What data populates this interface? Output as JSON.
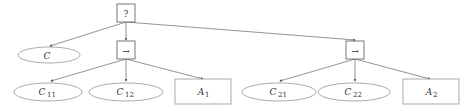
{
  "diagram": {
    "type": "tree",
    "colors": {
      "stroke": "#777777",
      "edge": "#666666",
      "text": "#333333",
      "background": "#ffffff"
    },
    "nodes": [
      {
        "id": "root",
        "shape": "square",
        "label": "?",
        "sub": ""
      },
      {
        "id": "c",
        "shape": "ellipse",
        "label": "C",
        "sub": ""
      },
      {
        "id": "seq1",
        "shape": "square",
        "label": "→",
        "sub": ""
      },
      {
        "id": "seq2",
        "shape": "square",
        "label": "→",
        "sub": ""
      },
      {
        "id": "c11",
        "shape": "ellipse",
        "label": "C",
        "sub": "11"
      },
      {
        "id": "c12",
        "shape": "ellipse",
        "label": "C",
        "sub": "12"
      },
      {
        "id": "a1",
        "shape": "rectangle",
        "label": "A",
        "sub": "1"
      },
      {
        "id": "c21",
        "shape": "ellipse",
        "label": "C",
        "sub": "21"
      },
      {
        "id": "c22",
        "shape": "ellipse",
        "label": "C",
        "sub": "22"
      },
      {
        "id": "a2",
        "shape": "rectangle",
        "label": "A",
        "sub": "2"
      }
    ],
    "edges": [
      {
        "from": "root",
        "to": "c"
      },
      {
        "from": "root",
        "to": "seq1"
      },
      {
        "from": "root",
        "to": "seq2"
      },
      {
        "from": "seq1",
        "to": "c11"
      },
      {
        "from": "seq1",
        "to": "c12"
      },
      {
        "from": "seq1",
        "to": "a1"
      },
      {
        "from": "seq2",
        "to": "c21"
      },
      {
        "from": "seq2",
        "to": "c22"
      },
      {
        "from": "seq2",
        "to": "a2"
      }
    ]
  }
}
